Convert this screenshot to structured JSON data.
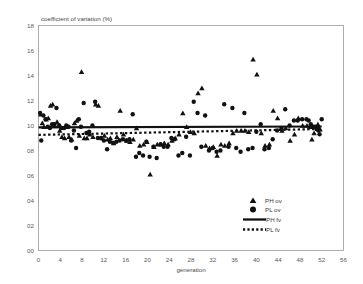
{
  "chart_data": {
    "type": "scatter",
    "title": "coefficient of variation (%)",
    "xlabel": "generation",
    "ylabel": "coefficient of variation (%)",
    "xlim": [
      0,
      56
    ],
    "ylim": [
      0,
      18
    ],
    "xticks": [
      "0",
      "4",
      "8",
      "12",
      "16",
      "20",
      "24",
      "28",
      "32",
      "36",
      "40",
      "44",
      "48",
      "52",
      "56"
    ],
    "yticks": [
      "00",
      "02",
      "04",
      "06",
      "08",
      "10",
      "12",
      "14",
      "16",
      "18"
    ],
    "grid": false,
    "legend_position": "inside-lower-right",
    "legend": [
      {
        "label": "PH ov",
        "marker": "triangle"
      },
      {
        "label": "PL ov",
        "marker": "circle"
      },
      {
        "label": "PH fv",
        "marker": "solid-line"
      },
      {
        "label": "PL fv",
        "marker": "dotted-line"
      }
    ],
    "series": [
      {
        "name": "PH ov",
        "marker": "triangle",
        "color": "#111111",
        "points": [
          [
            0.4,
            10.9
          ],
          [
            0.7,
            10.2
          ],
          [
            1.0,
            9.9
          ],
          [
            1.4,
            10.5
          ],
          [
            1.8,
            10.6
          ],
          [
            2.2,
            11.6
          ],
          [
            2.6,
            11.7
          ],
          [
            3.0,
            10.0
          ],
          [
            3.4,
            10.3
          ],
          [
            3.9,
            9.6
          ],
          [
            4.3,
            9.1
          ],
          [
            4.8,
            9.0
          ],
          [
            5.2,
            9.9
          ],
          [
            5.6,
            9.1
          ],
          [
            6.1,
            8.9
          ],
          [
            6.6,
            10.2
          ],
          [
            7.0,
            10.4
          ],
          [
            7.5,
            9.2
          ],
          [
            7.9,
            14.3
          ],
          [
            8.4,
            9.0
          ],
          [
            8.9,
            9.0
          ],
          [
            9.4,
            9.3
          ],
          [
            10.0,
            9.1
          ],
          [
            10.5,
            11.7
          ],
          [
            11.0,
            11.6
          ],
          [
            11.6,
            9.0
          ],
          [
            12.1,
            9.2
          ],
          [
            12.7,
            8.9
          ],
          [
            13.2,
            9.0
          ],
          [
            13.8,
            8.6
          ],
          [
            14.4,
            9.1
          ],
          [
            15.0,
            11.2
          ],
          [
            15.6,
            9.3
          ],
          [
            16.2,
            8.8
          ],
          [
            16.8,
            8.7
          ],
          [
            17.4,
            8.9
          ],
          [
            18.0,
            9.8
          ],
          [
            18.6,
            8.4
          ],
          [
            19.3,
            8.5
          ],
          [
            19.9,
            8.7
          ],
          [
            20.5,
            6.1
          ],
          [
            21.2,
            8.3
          ],
          [
            21.8,
            8.5
          ],
          [
            22.5,
            8.5
          ],
          [
            23.1,
            8.6
          ],
          [
            23.8,
            8.5
          ],
          [
            24.5,
            8.8
          ],
          [
            25.1,
            9.0
          ],
          [
            25.8,
            9.3
          ],
          [
            26.5,
            11.0
          ],
          [
            27.2,
            9.9
          ],
          [
            27.9,
            9.5
          ],
          [
            28.6,
            9.4
          ],
          [
            29.3,
            12.6
          ],
          [
            30.0,
            13.0
          ],
          [
            30.7,
            8.4
          ],
          [
            31.4,
            8.2
          ],
          [
            32.1,
            8.3
          ],
          [
            32.8,
            7.6
          ],
          [
            33.5,
            8.5
          ],
          [
            34.2,
            8.4
          ],
          [
            35.0,
            8.6
          ],
          [
            35.7,
            9.4
          ],
          [
            36.4,
            9.6
          ],
          [
            37.2,
            9.6
          ],
          [
            37.9,
            9.6
          ],
          [
            38.6,
            9.5
          ],
          [
            39.4,
            15.3
          ],
          [
            40.1,
            14.1
          ],
          [
            40.9,
            9.4
          ],
          [
            41.6,
            8.4
          ],
          [
            42.4,
            8.5
          ],
          [
            43.1,
            11.2
          ],
          [
            43.9,
            10.6
          ],
          [
            44.7,
            9.6
          ],
          [
            45.4,
            9.8
          ],
          [
            46.2,
            8.8
          ],
          [
            47.0,
            9.3
          ],
          [
            47.7,
            10.6
          ],
          [
            48.5,
            10.0
          ],
          [
            49.3,
            10.0
          ],
          [
            49.8,
            9.9
          ],
          [
            50.2,
            8.9
          ],
          [
            50.6,
            9.4
          ],
          [
            51.0,
            9.9
          ],
          [
            51.3,
            10.1
          ],
          [
            51.5,
            9.8
          ],
          [
            51.7,
            9.7
          ]
        ]
      },
      {
        "name": "PL ov",
        "marker": "circle",
        "color": "#111111",
        "points": [
          [
            0.3,
            11.0
          ],
          [
            0.5,
            8.8
          ],
          [
            0.9,
            10.8
          ],
          [
            1.3,
            10.5
          ],
          [
            1.7,
            9.9
          ],
          [
            2.1,
            9.8
          ],
          [
            2.5,
            10.1
          ],
          [
            2.9,
            10.1
          ],
          [
            3.3,
            11.4
          ],
          [
            3.8,
            10.0
          ],
          [
            4.2,
            9.8
          ],
          [
            4.7,
            9.8
          ],
          [
            5.1,
            10.0
          ],
          [
            5.5,
            9.9
          ],
          [
            6.0,
            8.8
          ],
          [
            6.5,
            9.6
          ],
          [
            6.9,
            8.2
          ],
          [
            7.4,
            10.5
          ],
          [
            7.8,
            9.9
          ],
          [
            8.3,
            11.8
          ],
          [
            8.8,
            9.4
          ],
          [
            9.3,
            9.5
          ],
          [
            9.9,
            10.0
          ],
          [
            10.4,
            11.9
          ],
          [
            10.9,
            9.0
          ],
          [
            11.5,
            9.0
          ],
          [
            12.0,
            8.8
          ],
          [
            12.6,
            8.1
          ],
          [
            13.1,
            8.7
          ],
          [
            13.7,
            8.6
          ],
          [
            14.3,
            8.7
          ],
          [
            14.9,
            8.8
          ],
          [
            15.5,
            8.9
          ],
          [
            16.1,
            8.8
          ],
          [
            16.7,
            8.9
          ],
          [
            17.3,
            10.9
          ],
          [
            17.9,
            7.5
          ],
          [
            18.5,
            7.8
          ],
          [
            19.2,
            7.6
          ],
          [
            19.8,
            8.7
          ],
          [
            20.4,
            7.5
          ],
          [
            21.1,
            8.3
          ],
          [
            21.7,
            7.4
          ],
          [
            22.4,
            8.5
          ],
          [
            23.0,
            8.3
          ],
          [
            23.7,
            8.3
          ],
          [
            24.4,
            9.0
          ],
          [
            25.0,
            8.9
          ],
          [
            25.7,
            7.6
          ],
          [
            26.4,
            7.8
          ],
          [
            27.1,
            9.1
          ],
          [
            27.8,
            7.6
          ],
          [
            28.5,
            11.9
          ],
          [
            29.2,
            11.0
          ],
          [
            29.9,
            8.3
          ],
          [
            30.6,
            10.8
          ],
          [
            31.3,
            8.0
          ],
          [
            32.0,
            8.2
          ],
          [
            32.7,
            7.9
          ],
          [
            33.4,
            8.0
          ],
          [
            34.1,
            11.7
          ],
          [
            34.9,
            8.3
          ],
          [
            35.6,
            11.4
          ],
          [
            36.3,
            8.2
          ],
          [
            37.1,
            7.9
          ],
          [
            37.8,
            11.0
          ],
          [
            38.5,
            8.1
          ],
          [
            39.3,
            8.2
          ],
          [
            40.0,
            9.5
          ],
          [
            40.8,
            10.1
          ],
          [
            41.5,
            8.1
          ],
          [
            42.3,
            8.2
          ],
          [
            43.0,
            8.9
          ],
          [
            43.8,
            9.6
          ],
          [
            44.6,
            9.8
          ],
          [
            45.3,
            11.3
          ],
          [
            46.1,
            10.0
          ],
          [
            46.9,
            10.4
          ],
          [
            47.6,
            10.4
          ],
          [
            48.4,
            10.5
          ],
          [
            49.2,
            10.5
          ],
          [
            49.6,
            10.4
          ],
          [
            50.0,
            10.1
          ],
          [
            50.4,
            9.9
          ],
          [
            50.8,
            9.9
          ],
          [
            51.1,
            9.7
          ],
          [
            51.4,
            9.6
          ],
          [
            51.6,
            9.3
          ],
          [
            52.0,
            10.5
          ]
        ]
      }
    ],
    "fit_lines": [
      {
        "name": "PH fv",
        "style": "solid",
        "y_start": 9.85,
        "y_end": 9.92,
        "x_start": 0,
        "x_end": 52
      },
      {
        "name": "PL fv",
        "style": "dotted",
        "y_start": 9.25,
        "y_end": 9.72,
        "x_start": 0,
        "x_end": 52
      }
    ]
  }
}
